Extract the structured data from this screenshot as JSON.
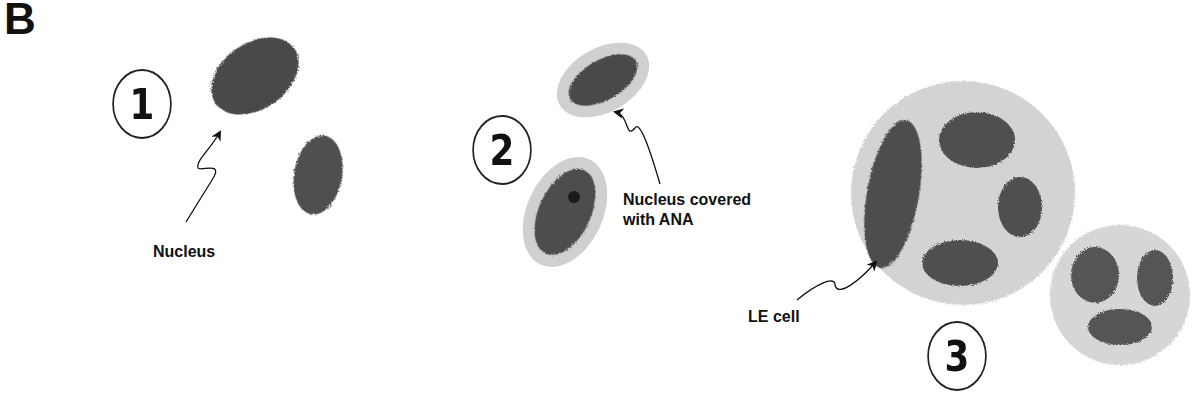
{
  "figure": {
    "panel_letter": "B",
    "stages": [
      {
        "number": "1",
        "label": "Nucleus"
      },
      {
        "number": "2",
        "label_line1": "Nucleus covered",
        "label_line2": "with ANA"
      },
      {
        "number": "3",
        "label": "LE cell"
      }
    ],
    "colors": {
      "nucleus": "#4a4a4a",
      "cytoplasm": "#cfcfcf",
      "text": "#111111"
    }
  }
}
